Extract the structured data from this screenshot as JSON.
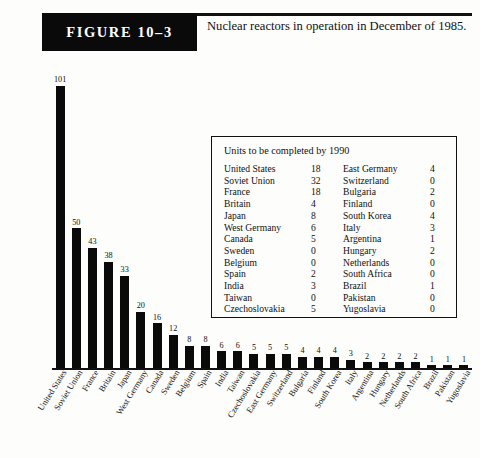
{
  "figure": {
    "banner_label": "FIGURE 10–3",
    "caption": "Nuclear reactors in operation in December of 1985."
  },
  "inset": {
    "title": "Units to be completed by 1990",
    "left_column": [
      {
        "name": "United States",
        "value": "18"
      },
      {
        "name": "Soviet Union",
        "value": "32"
      },
      {
        "name": "France",
        "value": "18"
      },
      {
        "name": "Britain",
        "value": "4"
      },
      {
        "name": "Japan",
        "value": "8"
      },
      {
        "name": "West Germany",
        "value": "6"
      },
      {
        "name": "Canada",
        "value": "5"
      },
      {
        "name": "Sweden",
        "value": "0"
      },
      {
        "name": "Belgium",
        "value": "0"
      },
      {
        "name": "Spain",
        "value": "2"
      },
      {
        "name": "India",
        "value": "3"
      },
      {
        "name": "Taiwan",
        "value": "0"
      },
      {
        "name": "Czechoslovakia",
        "value": "5"
      }
    ],
    "right_column": [
      {
        "name": "East Germany",
        "value": "4"
      },
      {
        "name": "Switzerland",
        "value": "0"
      },
      {
        "name": "Bulgaria",
        "value": "2"
      },
      {
        "name": "Finland",
        "value": "0"
      },
      {
        "name": "South Korea",
        "value": "4"
      },
      {
        "name": "Italy",
        "value": "3"
      },
      {
        "name": "Argentina",
        "value": "1"
      },
      {
        "name": "Hungary",
        "value": "2"
      },
      {
        "name": "Netherlands",
        "value": "0"
      },
      {
        "name": "South Africa",
        "value": "0"
      },
      {
        "name": "Brazil",
        "value": "1"
      },
      {
        "name": "Pakistan",
        "value": "0"
      },
      {
        "name": "Yugoslavia",
        "value": "0"
      }
    ]
  },
  "chart_data": {
    "type": "bar",
    "title": "Nuclear reactors in operation in December of 1985.",
    "xlabel": "",
    "ylabel": "",
    "ylim": [
      0,
      101
    ],
    "grid": false,
    "legend": "none",
    "bar_color": "#0a0a0a",
    "categories": [
      "United States",
      "Soviet Union",
      "France",
      "Britain",
      "Japan",
      "West Germany",
      "Canada",
      "Sweden",
      "Belgium",
      "Spain",
      "India",
      "Taiwan",
      "Czechoslovakia",
      "East Germany",
      "Switzerland",
      "Bulgaria",
      "Finland",
      "South Korea",
      "Italy",
      "Argentina",
      "Hungary",
      "Netherlands",
      "South Africa",
      "Brazil",
      "Pakistan",
      "Yugoslavia"
    ],
    "values": [
      101,
      50,
      43,
      38,
      33,
      20,
      16,
      12,
      8,
      8,
      6,
      6,
      5,
      5,
      5,
      4,
      4,
      4,
      3,
      2,
      2,
      2,
      2,
      1,
      1,
      1
    ]
  }
}
